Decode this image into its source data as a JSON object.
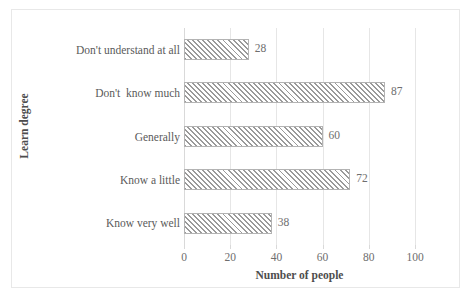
{
  "chart_data": {
    "type": "bar",
    "orientation": "horizontal",
    "title": "",
    "xlabel": "Number of people",
    "ylabel": "Learn degree",
    "categories": [
      "Know very well",
      "Know a little",
      "Generally",
      "Don't  know much",
      "Don't understand at all"
    ],
    "values": [
      38,
      72,
      60,
      87,
      28
    ],
    "value_labels": [
      "38",
      "72",
      "60",
      "87",
      "28"
    ],
    "xlim": [
      0,
      100
    ],
    "xticks": [
      0,
      20,
      40,
      60,
      80,
      100
    ],
    "xtick_labels": [
      "0",
      "20",
      "40",
      "60",
      "80",
      "100"
    ],
    "grid": "vertical",
    "legend": "none",
    "bar_fill": "diagonal-hatch",
    "colors": {
      "hatch": "#9a9a9a",
      "bar_border": "#b3b3b3",
      "gridline": "#e6e6e6",
      "text": "#5a5a5a",
      "frame_border": "#e8e8e8"
    }
  }
}
